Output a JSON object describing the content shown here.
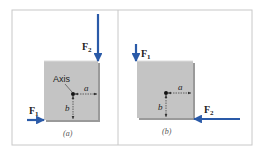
{
  "figure": {
    "colors": {
      "frame": "#c8c8c8",
      "block_fill": "#c4c4c4",
      "block_shadow": "#9a9a9a",
      "arrow": "#2a5aa8",
      "text": "#222222",
      "caption": "#555555"
    },
    "panels": [
      {
        "id": "a",
        "caption": "(a)",
        "axis_label": "Axis",
        "dim_a": "a",
        "dim_b": "b",
        "forces": [
          {
            "name": "F",
            "sub": "1",
            "direction": "right",
            "location": "bottom-left corner"
          },
          {
            "name": "F",
            "sub": "2",
            "direction": "down",
            "location": "top-right corner"
          }
        ]
      },
      {
        "id": "b",
        "caption": "(b)",
        "dim_a": "a",
        "dim_b": "b",
        "forces": [
          {
            "name": "F",
            "sub": "1",
            "direction": "down",
            "location": "top-left corner"
          },
          {
            "name": "F",
            "sub": "2",
            "direction": "left",
            "location": "bottom-right corner"
          }
        ]
      }
    ]
  }
}
